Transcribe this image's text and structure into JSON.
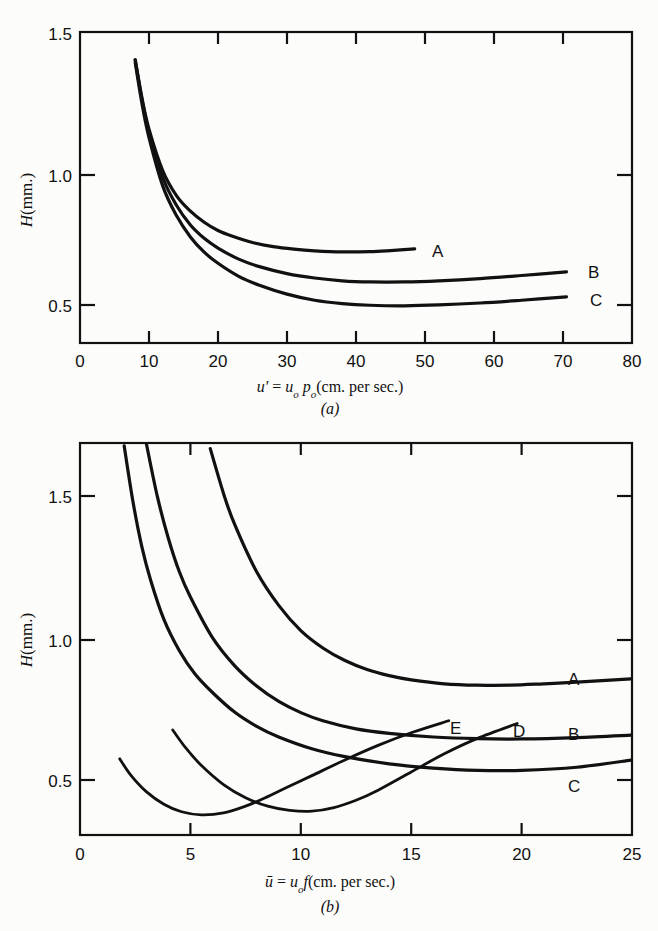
{
  "figure": {
    "background_color": "#fcfcfa",
    "ink_color": "#111111"
  },
  "panel_a": {
    "caption": "(a)",
    "ylabel_main": "H",
    "ylabel_unit": "(mm.)",
    "xlabel_parts": {
      "sym": "u′",
      "eq": " = ",
      "var1": "u",
      "sub1": "o",
      "var2": " p",
      "sub2": "o",
      "unit": "(cm. per sec.)"
    },
    "xlabel_full": "u′ = uₒ pₒ(cm. per sec.)",
    "x_ticklabels": [
      "0",
      "10",
      "20",
      "30",
      "40",
      "50",
      "60",
      "70",
      "80"
    ],
    "y_ticklabels": [
      "0.5",
      "1.0",
      "1.5"
    ],
    "curve_labels": [
      "A",
      "B",
      "C"
    ]
  },
  "panel_b": {
    "caption": "(b)",
    "ylabel_main": "H",
    "ylabel_unit": "(mm.)",
    "xlabel_parts": {
      "sym": "ū",
      "eq": " = ",
      "var1": "u",
      "sub1": "o",
      "var2": "f",
      "unit": "(cm. per sec.)"
    },
    "xlabel_full": "ū = uₒf(cm. per sec.)",
    "x_ticklabels": [
      "0",
      "5",
      "10",
      "15",
      "20",
      "25"
    ],
    "y_ticklabels": [
      "0.5",
      "1.0",
      "1.5"
    ],
    "curve_labels": [
      "A",
      "B",
      "C",
      "D",
      "E"
    ]
  },
  "chart_data": [
    {
      "type": "line",
      "panel": "(a)",
      "title": "",
      "xlabel": "u′ = uₒ pₒ(cm. per sec.)",
      "ylabel": "H (mm.)",
      "xlim": [
        0,
        80
      ],
      "ylim": [
        0.38,
        1.5
      ],
      "xticks": [
        0,
        10,
        20,
        30,
        40,
        50,
        60,
        70,
        80
      ],
      "yticks": [
        0.5,
        1.0,
        1.5
      ],
      "grid": false,
      "legend": "curve-end labels",
      "series": [
        {
          "name": "A",
          "x": [
            8,
            9,
            10,
            12,
            14,
            16,
            18,
            20,
            22,
            25,
            28,
            31,
            34,
            38,
            42,
            45,
            48.5
          ],
          "y": [
            1.4,
            1.26,
            1.15,
            1.0,
            0.91,
            0.855,
            0.815,
            0.785,
            0.765,
            0.742,
            0.727,
            0.718,
            0.712,
            0.708,
            0.709,
            0.713,
            0.719
          ]
        },
        {
          "name": "B",
          "x": [
            8,
            9,
            10,
            12,
            14,
            16,
            18,
            20,
            23,
            26,
            30,
            34,
            38,
            42,
            47,
            52,
            58,
            64,
            70.5
          ],
          "y": [
            1.4,
            1.255,
            1.14,
            0.975,
            0.875,
            0.805,
            0.757,
            0.722,
            0.682,
            0.655,
            0.63,
            0.614,
            0.604,
            0.6,
            0.6,
            0.604,
            0.612,
            0.623,
            0.636
          ]
        },
        {
          "name": "C",
          "x": [
            8,
            9,
            10,
            12,
            14,
            16,
            18,
            20,
            23,
            26,
            30,
            34,
            38,
            42,
            47,
            52,
            58,
            64,
            70.5
          ],
          "y": [
            1.39,
            1.24,
            1.12,
            0.945,
            0.838,
            0.762,
            0.707,
            0.667,
            0.62,
            0.588,
            0.556,
            0.534,
            0.522,
            0.516,
            0.514,
            0.517,
            0.524,
            0.534,
            0.546
          ]
        }
      ]
    },
    {
      "type": "line",
      "panel": "(b)",
      "title": "",
      "xlabel": "ū = uₒf(cm. per sec.)",
      "ylabel": "H (mm.)",
      "xlim": [
        0,
        25
      ],
      "ylim": [
        0.28,
        1.68
      ],
      "xticks": [
        0,
        5,
        10,
        15,
        20,
        25
      ],
      "yticks": [
        0.5,
        1.0,
        1.5
      ],
      "grid": false,
      "legend": "curve-end labels",
      "series": [
        {
          "name": "A",
          "x": [
            5.9,
            6.5,
            7,
            8,
            9,
            10,
            11,
            12,
            13,
            14,
            15,
            16.5,
            18,
            19.5,
            21,
            22.5,
            25
          ],
          "y": [
            1.66,
            1.5,
            1.39,
            1.22,
            1.1,
            1.01,
            0.948,
            0.903,
            0.871,
            0.849,
            0.834,
            0.82,
            0.815,
            0.815,
            0.82,
            0.826,
            0.838
          ]
        },
        {
          "name": "B",
          "x": [
            3.0,
            3.5,
            4,
            4.5,
            5,
            6,
            7,
            8,
            9,
            10,
            11,
            12.5,
            14,
            16,
            18,
            20,
            22.5,
            25
          ],
          "y": [
            1.68,
            1.49,
            1.34,
            1.22,
            1.13,
            0.985,
            0.885,
            0.812,
            0.757,
            0.717,
            0.688,
            0.659,
            0.643,
            0.63,
            0.624,
            0.623,
            0.628,
            0.637
          ]
        },
        {
          "name": "C",
          "x": [
            2.0,
            2.4,
            2.8,
            3.2,
            3.8,
            4.5,
            5.2,
            6,
            7,
            8,
            9,
            10.5,
            12,
            14,
            16,
            18,
            20,
            22.5,
            25
          ],
          "y": [
            1.67,
            1.47,
            1.31,
            1.19,
            1.05,
            0.938,
            0.856,
            0.789,
            0.719,
            0.668,
            0.63,
            0.588,
            0.56,
            0.534,
            0.519,
            0.511,
            0.511,
            0.522,
            0.548
          ]
        },
        {
          "name": "D",
          "x": [
            4.2,
            4.8,
            5.5,
            6.5,
            7.5,
            8.5,
            9.5,
            10.5,
            11.5,
            12.5,
            13.5,
            15,
            16.5,
            18,
            19.8
          ],
          "y": [
            0.655,
            0.59,
            0.528,
            0.46,
            0.413,
            0.383,
            0.368,
            0.365,
            0.378,
            0.404,
            0.44,
            0.505,
            0.57,
            0.625,
            0.678
          ]
        },
        {
          "name": "E",
          "x": [
            1.8,
            2.3,
            3.0,
            3.8,
            4.6,
            5.5,
            6.5,
            7.5,
            8.5,
            9.5,
            10.5,
            12,
            13.5,
            15,
            16.7
          ],
          "y": [
            0.552,
            0.494,
            0.435,
            0.39,
            0.363,
            0.352,
            0.359,
            0.383,
            0.417,
            0.455,
            0.492,
            0.548,
            0.6,
            0.645,
            0.688
          ]
        }
      ]
    }
  ]
}
